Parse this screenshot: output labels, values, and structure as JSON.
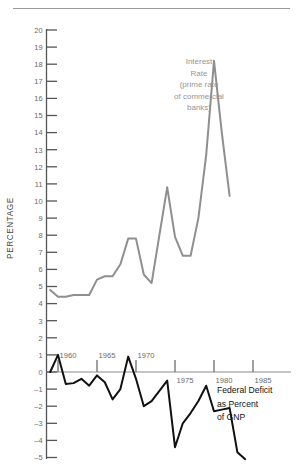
{
  "chart_data": {
    "type": "line",
    "title": "",
    "xlabel": "",
    "ylabel": "PERCENTAGE",
    "ylim": [
      -5,
      20
    ],
    "xlim": [
      1959,
      1986.5
    ],
    "grid": false,
    "legend_position": "inline-annotation",
    "y_ticks": [
      20,
      19,
      18,
      17,
      16,
      15,
      14,
      13,
      12,
      11,
      10,
      9,
      8,
      7,
      6,
      5,
      4,
      3,
      2,
      1,
      0,
      -1,
      -2,
      -3,
      -4,
      -5
    ],
    "y_tick_labels": [
      "20",
      "19",
      "18",
      "17",
      "16",
      "15",
      "14",
      "13",
      "12",
      "11",
      "10",
      "9",
      "8",
      "7",
      "6",
      "5",
      "4",
      "3",
      "2",
      "1",
      "0",
      "-1",
      "-2",
      "-3",
      "-4",
      "-5"
    ],
    "x_ticks": [
      1960,
      1965,
      1970,
      1975,
      1980,
      1985
    ],
    "x_tick_labels": [
      "1960",
      "1965",
      "1970",
      "1975",
      "1980",
      "1985"
    ],
    "zero_line": 0,
    "series": [
      {
        "name": "Interest Rate (prime rate of commercial banks)",
        "color": "#8f8f8f",
        "annotation": [
          "Interest",
          "Rate",
          "(prime rate",
          "of commercial",
          "banks)"
        ],
        "x": [
          1959,
          1960,
          1961,
          1962,
          1963,
          1964,
          1965,
          1966,
          1967,
          1968,
          1969,
          1970,
          1971,
          1972,
          1973,
          1974,
          1975,
          1976,
          1977,
          1978,
          1979,
          1980,
          1981,
          1982
        ],
        "values": [
          4.8,
          4.4,
          4.4,
          4.5,
          4.5,
          4.5,
          5.4,
          5.6,
          5.6,
          6.3,
          7.8,
          7.8,
          5.7,
          5.2,
          8.0,
          10.8,
          7.9,
          6.8,
          6.8,
          9.0,
          12.7,
          18.2,
          14.0,
          10.3
        ]
      },
      {
        "name": "Federal Deficit as Percent of GNP",
        "color": "#111111",
        "annotation": [
          "Federal Deficit",
          "as Percent",
          "of GNP"
        ],
        "x": [
          1959,
          1960,
          1961,
          1962,
          1963,
          1964,
          1965,
          1966,
          1967,
          1968,
          1969,
          1970,
          1971,
          1972,
          1973,
          1974,
          1975,
          1976,
          1977,
          1978,
          1979,
          1980,
          1981,
          1982,
          1983,
          1984
        ],
        "values": [
          0.0,
          1.0,
          -0.7,
          -0.65,
          -0.4,
          -0.8,
          -0.2,
          -0.6,
          -1.6,
          -1.0,
          0.9,
          -0.4,
          -2.0,
          -1.7,
          -1.1,
          -0.5,
          -4.4,
          -3.0,
          -2.4,
          -1.7,
          -0.8,
          -2.3,
          -2.2,
          -2.1,
          -4.7,
          -5.1
        ]
      }
    ]
  },
  "annotations": {
    "interest_rate_label": {
      "lines": [
        "Interest",
        "Rate",
        "(prime rate",
        "of commercial",
        "banks)"
      ]
    },
    "deficit_label": {
      "lines": [
        "Federal Deficit",
        "as Percent",
        "of GNP"
      ]
    }
  },
  "axis": {
    "y_title": "PERCENTAGE"
  }
}
